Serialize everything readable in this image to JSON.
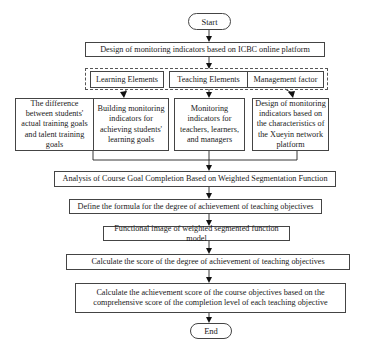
{
  "flowchart": {
    "start": "Start",
    "design": "Design of monitoring indicators based on ICBC online platform",
    "elements": [
      {
        "label": "Learning Elements"
      },
      {
        "label": "Teaching Elements"
      },
      {
        "label": "Management factor"
      }
    ],
    "indicators": [
      {
        "label": "The difference between students' actual training goals and talent training goals"
      },
      {
        "label": "Building monitoring indicators for achieving students' learning goals"
      },
      {
        "label": "Monitoring indicators for teachers, learners, and managers"
      },
      {
        "label": "Design of monitoring indicators based on the characteristics of the Xueyin network platform"
      }
    ],
    "steps": [
      {
        "label": "Analysis of Course Goal Completion Based on Weighted Segmentation Function"
      },
      {
        "label": "Define the formula for the degree of achievement of teaching objectives"
      },
      {
        "label": "Functional image of weighted segmented function model"
      },
      {
        "label": "Calculate the score of the degree of achievement of teaching objectives"
      },
      {
        "label": "Calculate the achievement score of the course objectives based on the comprehensive score of the completion level of each teaching objective"
      }
    ],
    "end": "End"
  },
  "colors": {
    "line": "#1a1a1a",
    "border": "#444444",
    "background": "#ffffff"
  }
}
